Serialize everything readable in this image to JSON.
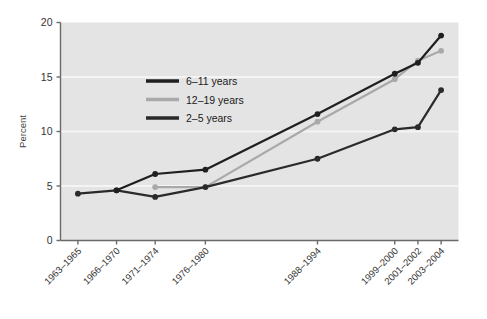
{
  "chart_data": {
    "type": "line",
    "title": "",
    "subtitle": "",
    "xlabel": "",
    "ylabel": "Percent",
    "ylim": [
      0,
      20
    ],
    "yticks": [
      0,
      5,
      10,
      15,
      20
    ],
    "ytick_labels": [
      "0",
      "5",
      "10",
      "15",
      "20"
    ],
    "grid": true,
    "grid_axis": "y",
    "legend_position": "upper-left-inside",
    "categories": [
      "1963–1965",
      "1966–1970",
      "1971–1974",
      "1976–1980",
      "1988–1994",
      "1999–2000",
      "2001–2002",
      "2003–2004"
    ],
    "category_positions": [
      0,
      1,
      2,
      3.3,
      6.2,
      8.2,
      8.8,
      9.4
    ],
    "xlim": [
      -0.45,
      9.85
    ],
    "series": [
      {
        "name": "6–11 years",
        "color": "#1f1f1f",
        "marker": "circle",
        "values": [
          null,
          4.6,
          6.1,
          6.5,
          11.6,
          15.3,
          16.3,
          18.8
        ]
      },
      {
        "name": "12–19 years",
        "color": "#a9a9a9",
        "marker": "circle",
        "values": [
          null,
          null,
          4.9,
          4.9,
          10.9,
          14.8,
          16.5,
          17.4
        ]
      },
      {
        "name": "2–5 years",
        "color": "#2a2a2a",
        "marker": "circle",
        "values": [
          4.3,
          4.6,
          4.0,
          4.9,
          7.5,
          10.2,
          10.4,
          13.8
        ]
      }
    ],
    "plot_background": "#e4e4e4",
    "gridline_color": "#f4f4f4",
    "axis_color": "#6a6a6a"
  },
  "legend": {
    "items": [
      {
        "label": "6–11 years"
      },
      {
        "label": "12–19 years"
      },
      {
        "label": "2–5 years"
      }
    ]
  }
}
